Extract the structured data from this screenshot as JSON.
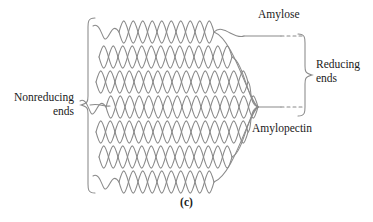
{
  "figure": {
    "caption": "(c)",
    "background_color": "#ffffff",
    "stroke_color": "#8a8a8a",
    "text_color": "#1a1a1a",
    "width": 373,
    "height": 222
  },
  "labels": {
    "nonreducing_ends": "Nonreducing\nends",
    "amylose": "Amylose",
    "reducing_ends": "Reducing\nends",
    "amylopectin": "Amylopectin"
  },
  "diagram": {
    "type": "molecular-structure-schematic",
    "chain_row_count": 7,
    "rows": [
      {
        "index": 1,
        "y": 32,
        "lead_in": "single-wave",
        "loop_count": 5,
        "right_x": 214,
        "exits": "amylose"
      },
      {
        "index": 2,
        "y": 57,
        "lead_in": "crossed-pair",
        "loop_count": 6,
        "right_x": 232,
        "exits": "none"
      },
      {
        "index": 3,
        "y": 82,
        "lead_in": "crossed-pair",
        "loop_count": 7,
        "right_x": 248,
        "exits": "none"
      },
      {
        "index": 4,
        "y": 107,
        "lead_in": "single-wave",
        "loop_count": 8,
        "right_x": 258,
        "exits": "amylopectin"
      },
      {
        "index": 5,
        "y": 132,
        "lead_in": "crossed-pair",
        "loop_count": 7,
        "right_x": 248,
        "exits": "none"
      },
      {
        "index": 6,
        "y": 157,
        "lead_in": "crossed-pair",
        "loop_count": 6,
        "right_x": 232,
        "exits": "none"
      },
      {
        "index": 7,
        "y": 182,
        "lead_in": "single-wave",
        "loop_count": 5,
        "right_x": 214,
        "exits": "none"
      }
    ],
    "left_brace": {
      "x": 88,
      "top": 18,
      "bottom": 193,
      "notch_y": 105,
      "opens": "right"
    },
    "right_brace": {
      "x": 305,
      "top": 34,
      "bottom": 116,
      "notch_y": 75,
      "opens": "left"
    },
    "amylose_connector": {
      "from_x": 214,
      "to_x": 303,
      "y": 32,
      "dashed_tail": true
    },
    "amylopectin_connector": {
      "from_x": 258,
      "to_x": 303,
      "y": 107,
      "dashed_tail": true
    }
  }
}
